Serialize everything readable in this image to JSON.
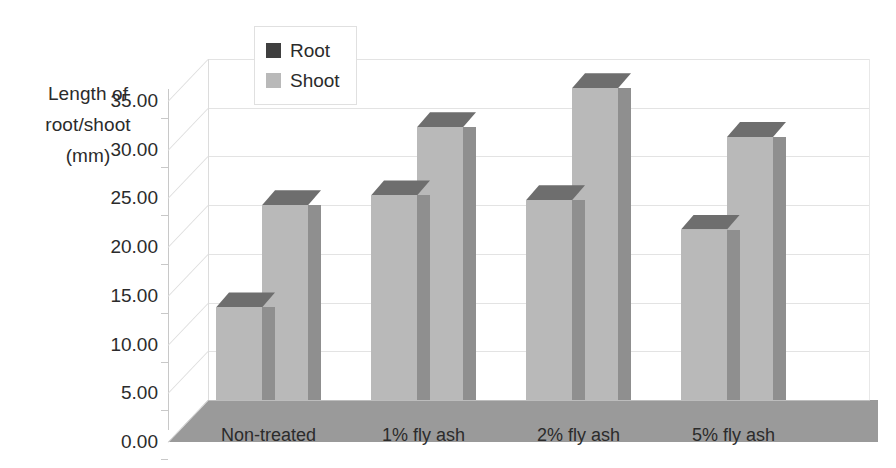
{
  "chart_data": {
    "type": "bar",
    "title": "",
    "xlabel": "",
    "ylabel": "Length of root/shoot (mm)",
    "ylabel_lines": [
      "Length of",
      "root/shoot",
      "(mm)"
    ],
    "categories": [
      "Non-treated",
      "1% fly ash",
      "2% fly ash",
      "5% fly ash"
    ],
    "series": [
      {
        "name": "Root",
        "values": [
          9.5,
          21.0,
          20.5,
          17.5
        ],
        "color": "#3f3f3f"
      },
      {
        "name": "Shoot",
        "values": [
          20.0,
          28.0,
          32.0,
          27.0
        ],
        "color": "#b9b9b9"
      }
    ],
    "ylim": [
      0,
      35
    ],
    "ytick_step": 5,
    "yticks": [
      "0.00",
      "5.00",
      "10.00",
      "15.00",
      "20.00",
      "25.00",
      "30.00",
      "35.00"
    ],
    "grid": true,
    "legend_position": "top-left-inside",
    "three_d": true
  },
  "legend": {
    "entries": [
      {
        "label": "Root",
        "swatch_color": "#3f3f3f"
      },
      {
        "label": "Shoot",
        "swatch_color": "#b9b9b9"
      }
    ]
  },
  "style": {
    "bar_face": "#b9b9b9",
    "bar_side": "#8f8f8f",
    "bar_top": "#6e6e6e",
    "floor": "#9a9a9a",
    "gridline": "#e3e3e3",
    "text": "#2b2b2b",
    "background": "#ffffff"
  }
}
